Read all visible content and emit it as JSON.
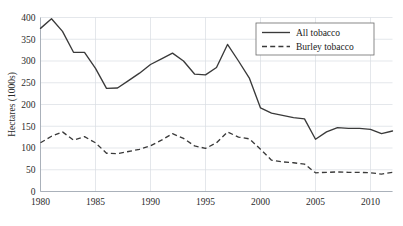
{
  "chart_data": {
    "type": "line",
    "title": "",
    "xlabel": "",
    "ylabel": "Hectares (1000s)",
    "xlim": [
      1980,
      2012
    ],
    "ylim": [
      0,
      400
    ],
    "grid": true,
    "legend_position": "top-right",
    "x": [
      1980,
      1981,
      1982,
      1983,
      1984,
      1985,
      1986,
      1987,
      1988,
      1989,
      1990,
      1991,
      1992,
      1993,
      1994,
      1995,
      1996,
      1997,
      1998,
      1999,
      2000,
      2001,
      2002,
      2003,
      2004,
      2005,
      2006,
      2007,
      2008,
      2009,
      2010,
      2011,
      2012
    ],
    "xticks": [
      1980,
      1985,
      1990,
      1995,
      2000,
      2005,
      2010
    ],
    "xtick_labels": [
      "1980",
      "1985",
      "1990",
      "1995",
      "2000",
      "2005",
      "2010"
    ],
    "yticks": [
      0,
      50,
      100,
      150,
      200,
      250,
      300,
      350,
      400
    ],
    "ytick_labels": [
      "0",
      "50",
      "100",
      "150",
      "200",
      "250",
      "300",
      "350",
      "400"
    ],
    "series": [
      {
        "name": "All tobacco",
        "style": "solid",
        "color": "#3a3a3a",
        "values": [
          375,
          397,
          368,
          320,
          320,
          283,
          237,
          238,
          255,
          272,
          292,
          305,
          318,
          300,
          270,
          268,
          285,
          338,
          300,
          260,
          192,
          180,
          175,
          170,
          167,
          120,
          137,
          147,
          145,
          145,
          143,
          133,
          139
        ]
      },
      {
        "name": "Burley tobacco",
        "style": "dashed",
        "color": "#3a3a3a",
        "values": [
          112,
          127,
          137,
          118,
          126,
          112,
          88,
          87,
          92,
          97,
          105,
          118,
          133,
          122,
          105,
          99,
          112,
          137,
          125,
          121,
          97,
          72,
          68,
          66,
          63,
          43,
          44,
          45,
          44,
          44,
          43,
          40,
          44
        ]
      }
    ]
  },
  "legend": {
    "entries": [
      {
        "label": "All tobacco",
        "style": "solid"
      },
      {
        "label": "Burley tobacco",
        "style": "dashed"
      }
    ]
  }
}
